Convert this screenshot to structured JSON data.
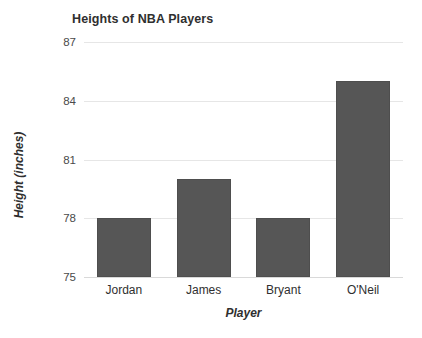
{
  "chart_data": {
    "type": "bar",
    "title": "Heights of NBA Players",
    "xlabel": "Player",
    "ylabel": "Height (inches)",
    "categories": [
      "Jordan",
      "James",
      "Bryant",
      "O'Neil"
    ],
    "values": [
      78,
      80,
      78,
      85
    ],
    "ylim": [
      75,
      87
    ],
    "yticks": [
      75,
      78,
      81,
      84,
      87
    ],
    "ytick_labels": [
      "75",
      "78",
      "81",
      "84",
      "87"
    ],
    "grid": true,
    "legend": null,
    "series": [
      {
        "name": "Height (inches)",
        "values": [
          78,
          80,
          78,
          85
        ]
      }
    ],
    "colors": {
      "bar_fill": "#565656",
      "bar_edge": "#4e4e4e",
      "gridline": "#e6e6e6",
      "background": "#ffffff",
      "text": "#2f2f2f"
    }
  }
}
